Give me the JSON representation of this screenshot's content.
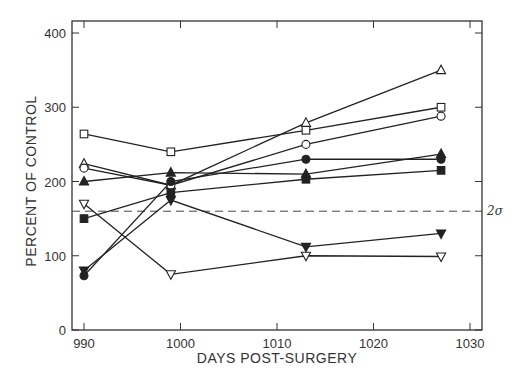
{
  "chart_data": {
    "type": "line",
    "title": "",
    "xlabel": "DAYS POST-SURGERY",
    "ylabel": "PERCENT OF CONTROL",
    "xlim": [
      988,
      1031
    ],
    "ylim": [
      0,
      415
    ],
    "x_ticks": [
      990,
      1000,
      1010,
      1020,
      1030
    ],
    "x_tick_labels": [
      "990",
      "1000",
      "1010",
      "1020",
      "1030"
    ],
    "y_ticks": [
      0,
      100,
      200,
      300,
      400
    ],
    "y_tick_labels": [
      "0",
      "100",
      "200",
      "300",
      "400"
    ],
    "grid": false,
    "legend": "none",
    "x": [
      990,
      999,
      1013,
      1027
    ],
    "series": [
      {
        "name": "open-square",
        "marker": "square-open",
        "values": [
          264,
          240,
          269,
          300
        ]
      },
      {
        "name": "open-triangle-up",
        "marker": "triangle-up-open",
        "values": [
          224,
          195,
          279,
          350
        ]
      },
      {
        "name": "open-circle",
        "marker": "circle-open",
        "values": [
          218,
          195,
          250,
          288
        ]
      },
      {
        "name": "filled-circle",
        "marker": "circle-filled",
        "values": [
          73,
          200,
          230,
          230
        ]
      },
      {
        "name": "filled-triangle-up",
        "marker": "triangle-up-filled",
        "values": [
          200,
          212,
          210,
          237
        ]
      },
      {
        "name": "filled-square",
        "marker": "square-filled",
        "values": [
          150,
          185,
          203,
          215
        ]
      },
      {
        "name": "filled-triangle-down",
        "marker": "triangle-down-filled",
        "values": [
          80,
          175,
          112,
          130
        ]
      },
      {
        "name": "open-triangle-down",
        "marker": "triangle-down-open",
        "values": [
          170,
          75,
          100,
          99
        ]
      }
    ],
    "reference_lines": [
      {
        "type": "horizontal",
        "y": 160,
        "style": "dashed",
        "label": "2σ"
      }
    ]
  },
  "labels": {
    "xlabel": "DAYS POST-SURGERY",
    "ylabel": "PERCENT OF CONTROL",
    "sigma": "2σ"
  }
}
